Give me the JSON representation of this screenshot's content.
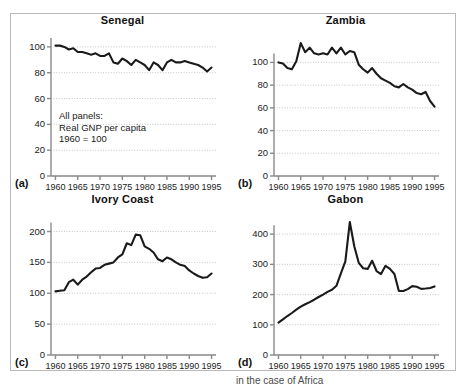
{
  "figure": {
    "annotation_lines": [
      "All panels:",
      "Real GNP per capita",
      "1960 = 100"
    ],
    "panel_letters": [
      "(a)",
      "(b)",
      "(c)",
      "(d)"
    ],
    "line_color": "#1a1a1a",
    "grid_color": "#b0b6c2",
    "axis_color": "#8a8a8a",
    "frame_color": "#b9b9b9",
    "caption_fragment": "in the case of Africa"
  },
  "chart_data": [
    {
      "type": "line",
      "title": "Senegal",
      "panel_letter": "(a)",
      "xlabel": "",
      "ylabel": "",
      "xlim": [
        1959,
        1996
      ],
      "ylim": [
        0,
        110
      ],
      "yticks": [
        0,
        20,
        40,
        60,
        80,
        100
      ],
      "xticks": [
        1960,
        1965,
        1970,
        1975,
        1980,
        1985,
        1990,
        1995
      ],
      "grid": true,
      "annotation": "All panels:\nReal GNP per capita\n1960 = 100",
      "x": [
        1960,
        1961,
        1962,
        1963,
        1964,
        1965,
        1966,
        1967,
        1968,
        1969,
        1970,
        1971,
        1972,
        1973,
        1974,
        1975,
        1976,
        1977,
        1978,
        1979,
        1980,
        1981,
        1982,
        1983,
        1984,
        1985,
        1986,
        1987,
        1988,
        1989,
        1990,
        1991,
        1992,
        1993,
        1994,
        1995
      ],
      "values": [
        101,
        101,
        100,
        98,
        99,
        96,
        96,
        95,
        94,
        95,
        93,
        93,
        95,
        88,
        87,
        91,
        89,
        86,
        90,
        88,
        86,
        82,
        88,
        86,
        82,
        88,
        90,
        88,
        88,
        89,
        88,
        87,
        86,
        84,
        81,
        84
      ]
    },
    {
      "type": "line",
      "title": "Zambia",
      "panel_letter": "(b)",
      "xlabel": "",
      "ylabel": "",
      "xlim": [
        1959,
        1996
      ],
      "ylim": [
        0,
        125
      ],
      "yticks": [
        0,
        20,
        40,
        60,
        80,
        100
      ],
      "xticks": [
        1960,
        1965,
        1970,
        1975,
        1980,
        1985,
        1990,
        1995
      ],
      "grid": true,
      "x": [
        1960,
        1961,
        1962,
        1963,
        1964,
        1965,
        1966,
        1967,
        1968,
        1969,
        1970,
        1971,
        1972,
        1973,
        1974,
        1975,
        1976,
        1977,
        1978,
        1979,
        1980,
        1981,
        1982,
        1983,
        1984,
        1985,
        1986,
        1987,
        1988,
        1989,
        1990,
        1991,
        1992,
        1993,
        1994,
        1995
      ],
      "values": [
        100,
        99,
        95,
        94,
        101,
        117,
        109,
        113,
        108,
        107,
        108,
        107,
        113,
        108,
        113,
        107,
        110,
        109,
        98,
        94,
        91,
        95,
        90,
        86,
        84,
        82,
        79,
        78,
        81,
        78,
        76,
        73,
        72,
        74,
        66,
        61
      ]
    },
    {
      "type": "line",
      "title": "Ivory Coast",
      "panel_letter": "(c)",
      "xlabel": "",
      "ylabel": "",
      "xlim": [
        1959,
        1996
      ],
      "ylim": [
        0,
        230
      ],
      "yticks": [
        0,
        50,
        100,
        150,
        200
      ],
      "xticks": [
        1960,
        1965,
        1970,
        1975,
        1980,
        1985,
        1990,
        1995
      ],
      "grid": true,
      "x": [
        1960,
        1961,
        1962,
        1963,
        1964,
        1965,
        1966,
        1967,
        1968,
        1969,
        1970,
        1971,
        1972,
        1973,
        1974,
        1975,
        1976,
        1977,
        1978,
        1979,
        1980,
        1981,
        1982,
        1983,
        1984,
        1985,
        1986,
        1987,
        1988,
        1989,
        1990,
        1991,
        1992,
        1993,
        1994,
        1995
      ],
      "values": [
        103,
        104,
        105,
        118,
        122,
        114,
        122,
        127,
        134,
        140,
        141,
        146,
        148,
        150,
        158,
        163,
        181,
        178,
        195,
        194,
        176,
        172,
        166,
        155,
        152,
        158,
        155,
        150,
        146,
        144,
        137,
        132,
        128,
        125,
        126,
        132
      ]
    },
    {
      "type": "line",
      "title": "Gabon",
      "panel_letter": "(d)",
      "xlabel": "",
      "ylabel": "",
      "xlim": [
        1959,
        1996
      ],
      "ylim": [
        0,
        470
      ],
      "yticks": [
        0,
        100,
        200,
        300,
        400
      ],
      "xticks": [
        1960,
        1965,
        1970,
        1975,
        1980,
        1985,
        1990,
        1995
      ],
      "grid": true,
      "x": [
        1960,
        1961,
        1962,
        1963,
        1964,
        1965,
        1966,
        1967,
        1968,
        1969,
        1970,
        1971,
        1972,
        1973,
        1974,
        1975,
        1976,
        1977,
        1978,
        1979,
        1980,
        1981,
        1982,
        1983,
        1984,
        1985,
        1986,
        1987,
        1988,
        1989,
        1990,
        1991,
        1992,
        1993,
        1994,
        1995
      ],
      "values": [
        107,
        118,
        129,
        139,
        150,
        160,
        168,
        175,
        183,
        192,
        200,
        209,
        216,
        229,
        270,
        310,
        440,
        360,
        305,
        287,
        285,
        312,
        278,
        268,
        295,
        285,
        268,
        212,
        212,
        218,
        228,
        226,
        219,
        220,
        222,
        227
      ]
    }
  ]
}
